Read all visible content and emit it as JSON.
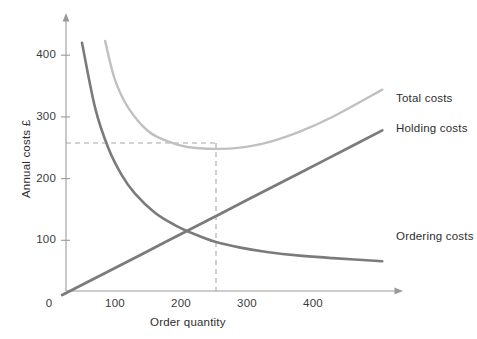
{
  "chart_data": {
    "type": "line",
    "title": "",
    "xlabel": "Order quantity",
    "ylabel": "Annual costs £",
    "xlim": [
      0,
      520
    ],
    "ylim": [
      0,
      455
    ],
    "grid": false,
    "legend_position": "right-inline",
    "x_ticks": [
      "0",
      "100",
      "200",
      "300",
      "400"
    ],
    "x_tick_values": [
      0,
      100,
      200,
      300,
      400
    ],
    "y_ticks": [
      "100",
      "200",
      "300",
      "400"
    ],
    "y_tick_values": [
      100,
      200,
      300,
      400
    ],
    "series": [
      {
        "name": "Holding costs",
        "color": "#7b7b7b",
        "type": "line",
        "x": [
          20,
          60,
          100,
          140,
          180,
          220,
          260,
          300,
          340,
          380,
          420,
          460,
          505
        ],
        "values": [
          11,
          33,
          55,
          77,
          99,
          121,
          143,
          165,
          187,
          209,
          231,
          253,
          278
        ]
      },
      {
        "name": "Ordering costs",
        "color": "#7b7b7b",
        "type": "line",
        "x": [
          50,
          70,
          90,
          110,
          130,
          160,
          190,
          220,
          253,
          290,
          330,
          380,
          430,
          505
        ],
        "values": [
          420,
          314,
          249,
          206,
          176,
          145,
          125,
          110,
          97,
          88,
          81,
          75,
          71,
          66
        ]
      },
      {
        "name": "Total costs",
        "color": "#c0c0c0",
        "type": "line",
        "x": [
          85,
          100,
          120,
          150,
          180,
          210,
          253,
          290,
          330,
          380,
          430,
          505
        ],
        "values": [
          423,
          360,
          315,
          277,
          260,
          251,
          248,
          250,
          258,
          276,
          300,
          344
        ]
      }
    ],
    "annotations": [
      {
        "name": "optimal-quantity-guide",
        "type": "dashed-vertical",
        "x": 253,
        "y_from": 0,
        "y_to": 256,
        "color": "#a8a8a8"
      },
      {
        "name": "minimum-cost-guide",
        "type": "dashed-horizontal",
        "y": 256,
        "x_from": 0,
        "x_to": 253,
        "color": "#a8a8a8"
      }
    ]
  },
  "axes": {
    "x_title": "Order quantity",
    "y_title": "Annual costs £",
    "x_tick_labels": [
      "0",
      "100",
      "200",
      "300",
      "400"
    ],
    "y_tick_labels": [
      "100",
      "200",
      "300",
      "400"
    ]
  },
  "legend": {
    "items": [
      {
        "label": "Total costs",
        "color": "#c0c0c0"
      },
      {
        "label": "Holding costs",
        "color": "#7b7b7b"
      },
      {
        "label": "Ordering costs",
        "color": "#7b7b7b"
      }
    ]
  },
  "colors": {
    "background": "#ffffff",
    "axis": "#9a9a9a",
    "tick_text": "#3a3a3a",
    "total_costs": "#c0c0c0",
    "holding_costs": "#7b7b7b",
    "ordering_costs": "#7b7b7b",
    "guide_dash": "#a8a8a8"
  }
}
